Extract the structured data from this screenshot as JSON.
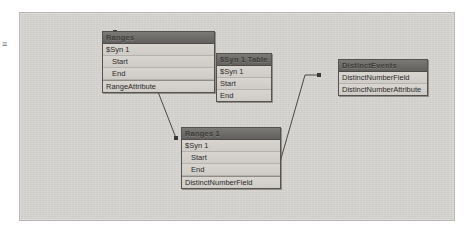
{
  "canvas": {
    "background_color": "#d6d4d0",
    "border_color": "#b9b7b3",
    "margin_mark": "≡"
  },
  "diagram": {
    "type": "entity-relationship-dataflow",
    "link_color": "#4a4846",
    "nodes": [
      {
        "id": "ranges",
        "title": "Ranges",
        "x": 82,
        "y": 18,
        "width": 113,
        "rows": [
          {
            "label": "$Syn 1",
            "indent": false,
            "separator_above": false
          },
          {
            "label": "Start",
            "indent": true,
            "separator_above": false
          },
          {
            "label": "End",
            "indent": true,
            "separator_above": false
          },
          {
            "label": "RangeAttribute",
            "indent": false,
            "separator_above": true
          }
        ]
      },
      {
        "id": "syn1table",
        "title": "$Syn 1 Table",
        "x": 196,
        "y": 40,
        "width": 56,
        "rows": [
          {
            "label": "$Syn 1",
            "indent": false,
            "separator_above": false
          },
          {
            "label": "Start",
            "indent": false,
            "separator_above": false
          },
          {
            "label": "End",
            "indent": false,
            "separator_above": false
          }
        ]
      },
      {
        "id": "distinctevents",
        "title": "DistinctEvents",
        "x": 318,
        "y": 46,
        "width": 90,
        "rows": [
          {
            "label": "DistinctNumberField",
            "indent": false,
            "separator_above": false
          },
          {
            "label": "DistinctNumberAttribute",
            "indent": false,
            "separator_above": false
          }
        ]
      },
      {
        "id": "ranges1",
        "title": "Ranges 1",
        "x": 161,
        "y": 114,
        "width": 100,
        "rows": [
          {
            "label": "$Syn 1",
            "indent": false,
            "separator_above": false
          },
          {
            "label": "Start",
            "indent": true,
            "separator_above": false
          },
          {
            "label": "End",
            "indent": true,
            "separator_above": false
          },
          {
            "label": "DistinctNumberField",
            "indent": false,
            "separator_above": true
          }
        ]
      }
    ],
    "links": [
      {
        "id": "ranges-to-junction",
        "from": "ranges",
        "to": "junction",
        "points": "95,19 126,48"
      },
      {
        "id": "junction-to-syn1table",
        "from": "junction",
        "to": "syn1table",
        "points": "126,48 158,33"
      },
      {
        "id": "junction-to-ranges1",
        "from": "junction",
        "to": "ranges1",
        "points": "126,48 156,125"
      },
      {
        "id": "ranges1-to-distinctevents",
        "from": "ranges1",
        "to": "distinctevents",
        "points": "242,163 256,163 285,62 299,62"
      }
    ],
    "junction": {
      "x": 126,
      "y": 48
    }
  }
}
